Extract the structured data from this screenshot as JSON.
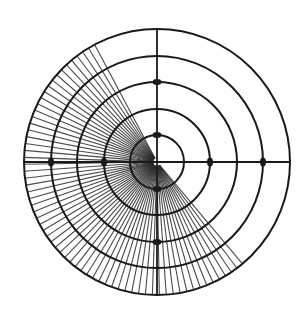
{
  "diagram": {
    "type": "polar-target-diagram",
    "center": [
      157,
      162
    ],
    "rings": [
      27,
      53,
      80,
      106,
      133
    ],
    "axes": [
      "horizontal",
      "vertical"
    ],
    "hatched_sector": {
      "start_angle_deg": 118,
      "end_angle_deg": 312,
      "direction": "counterclockwise",
      "line_spacing_deg": 3
    },
    "markers": [
      {
        "ring": 80,
        "angle_deg": 90
      },
      {
        "ring": 27,
        "angle_deg": 90
      },
      {
        "ring": 27,
        "angle_deg": 270
      },
      {
        "ring": 80,
        "angle_deg": 270
      },
      {
        "ring": 53,
        "angle_deg": 0
      },
      {
        "ring": 106,
        "angle_deg": 0
      },
      {
        "ring": 53,
        "angle_deg": 180
      },
      {
        "ring": 106,
        "angle_deg": 180
      }
    ],
    "colors": {
      "ink": "#1a1a1a",
      "hatch": "#2a2a2a",
      "background": "#ffffff"
    }
  }
}
